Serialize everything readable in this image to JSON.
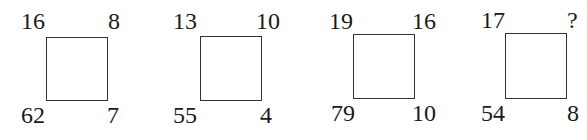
{
  "puzzles": [
    {
      "top_left": "16",
      "top_right": "8",
      "bottom_left": "62",
      "bottom_right": "7"
    },
    {
      "top_left": "13",
      "top_right": "10",
      "bottom_left": "55",
      "bottom_right": "4"
    },
    {
      "top_left": "19",
      "top_right": "16",
      "bottom_left": "79",
      "bottom_right": "10"
    },
    {
      "top_left": "17",
      "top_right": "?",
      "bottom_left": "54",
      "bottom_right": "8"
    }
  ]
}
